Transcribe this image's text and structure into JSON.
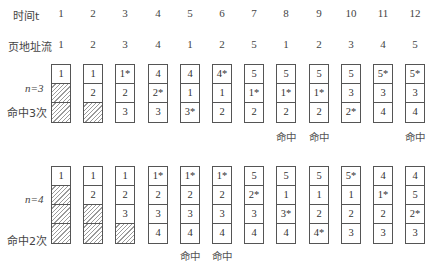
{
  "header": {
    "time_label": "时间t",
    "page_stream_label": "页地址流",
    "times": [
      "1",
      "2",
      "3",
      "4",
      "5",
      "6",
      "7",
      "8",
      "9",
      "10",
      "11",
      "12"
    ],
    "stream": [
      "1",
      "2",
      "3",
      "4",
      "1",
      "2",
      "5",
      "1",
      "2",
      "3",
      "4",
      "5"
    ]
  },
  "group_n3": {
    "n_label": "n=3",
    "hits_label": "命中3次",
    "hit_text": "命中",
    "hit_columns": [
      8,
      9,
      12
    ],
    "frames": [
      [
        "1",
        "",
        ""
      ],
      [
        "1",
        "2",
        ""
      ],
      [
        "1*",
        "2",
        "3"
      ],
      [
        "4",
        "2*",
        "3"
      ],
      [
        "4",
        "1",
        "3*"
      ],
      [
        "4*",
        "1",
        "2"
      ],
      [
        "5",
        "1*",
        "2"
      ],
      [
        "5",
        "1*",
        "2"
      ],
      [
        "5",
        "1*",
        "2"
      ],
      [
        "5",
        "3",
        "2*"
      ],
      [
        "5*",
        "3",
        "4"
      ],
      [
        "5*",
        "3",
        "4"
      ]
    ]
  },
  "group_n4": {
    "n_label": "n=4",
    "hits_label": "命中2次",
    "hit_text": "命中",
    "hit_columns": [
      5,
      6
    ],
    "frames": [
      [
        "1",
        "",
        "",
        ""
      ],
      [
        "1",
        "2",
        "",
        ""
      ],
      [
        "1",
        "2",
        "3",
        ""
      ],
      [
        "1*",
        "2",
        "3",
        "4"
      ],
      [
        "1*",
        "2",
        "3",
        "4"
      ],
      [
        "1*",
        "2",
        "3",
        "4"
      ],
      [
        "5",
        "2*",
        "3",
        "4"
      ],
      [
        "5",
        "1",
        "3*",
        "4"
      ],
      [
        "5",
        "1",
        "2",
        "4*"
      ],
      [
        "5*",
        "1",
        "2",
        "3"
      ],
      [
        "4",
        "1*",
        "2",
        "3"
      ],
      [
        "4",
        "5",
        "2*",
        "3"
      ]
    ]
  }
}
